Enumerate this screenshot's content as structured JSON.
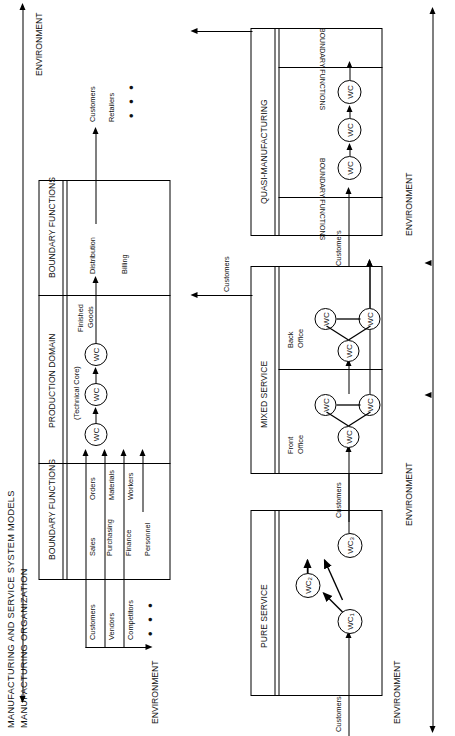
{
  "figure": {
    "title": "MANUFACTURING AND SERVICE SYSTEM MODELS",
    "subtitle": "MANUFACTURING ORGANIZATION",
    "ellipsis": "• • •"
  },
  "environment": {
    "label": "ENVIRONMENT",
    "top_left": "ENVIRONMENT",
    "bottom_left": "ENVIRONMENT",
    "right_top": "ENVIRONMENT",
    "right_middle": "ENVIRONMENT",
    "right_bottom": "ENVIRONMENT"
  },
  "manufacturing": {
    "panels": [
      {
        "id": "inbound-boundary",
        "label": "BOUNDARY FUNCTIONS"
      },
      {
        "id": "production-domain",
        "label": "PRODUCTION DOMAIN",
        "sublabel": "(Technical Core)"
      },
      {
        "id": "outbound-boundary",
        "label": "BOUNDARY FUNCTIONS"
      }
    ],
    "inbound_functions": [
      {
        "name": "Sales",
        "flow": "Orders"
      },
      {
        "name": "Purchasing",
        "flow": "Materials"
      },
      {
        "name": "Finance",
        "flow": "Workers"
      },
      {
        "name": "Personnel",
        "flow": ""
      }
    ],
    "outbound_functions": [
      {
        "name": "Distribution",
        "flow": "Finished\nGoods"
      },
      {
        "name": "Billing",
        "flow": ""
      }
    ],
    "outbound_flow_top": "Finished",
    "outbound_flow_bottom": "Goods",
    "distribution": "Distribution",
    "billing": "Billing",
    "inbound_environment_actors": [
      "Customers",
      "Vendors",
      "Competitors"
    ],
    "outbound_environment_actors": [
      "Customers",
      "Retailers"
    ],
    "work_centers": [
      "WC",
      "WC",
      "WC"
    ]
  },
  "pure_service": {
    "title": "PURE SERVICE",
    "customers_in": "Customers",
    "work_centers": [
      {
        "label": "WC",
        "sub": "1"
      },
      {
        "label": "WC",
        "sub": "2"
      },
      {
        "label": "WC",
        "sub": "3"
      }
    ]
  },
  "mixed_service": {
    "title": "MIXED SERVICE",
    "customers_in": "Customers",
    "customers_out": "Customers",
    "zones": [
      {
        "name_line1": "Front",
        "name_line2": "Office",
        "work_centers": [
          "WC",
          "WC",
          "WC"
        ]
      },
      {
        "name_line1": "Back",
        "name_line2": "Office",
        "work_centers": [
          "WC",
          "WC",
          "WC"
        ]
      }
    ]
  },
  "quasi_manufacturing": {
    "title": "QUASI-MANUFACTURING",
    "boundary_in": "BOUNDARY FUNCTIONS",
    "boundary_out": "BOUNDARY FUNCTIONS",
    "customers_in": "Customers",
    "work_centers": [
      "WC",
      "WC",
      "WC"
    ]
  },
  "colors": {
    "ink": "#000000",
    "paper": "#ffffff"
  }
}
